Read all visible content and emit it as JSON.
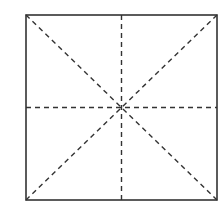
{
  "diagram": {
    "type": "square-grid-with-diagonals",
    "square": {
      "x1": 26,
      "y1": 15,
      "x2": 217,
      "y2": 200
    },
    "colors": {
      "border": "#333333",
      "dash": "#333333",
      "background": "#ffffff"
    },
    "lines": [
      {
        "name": "diagonal-main",
        "style": "dashed"
      },
      {
        "name": "diagonal-anti",
        "style": "dashed"
      },
      {
        "name": "center-horizontal",
        "style": "dashed"
      },
      {
        "name": "center-vertical",
        "style": "dashed"
      }
    ]
  }
}
